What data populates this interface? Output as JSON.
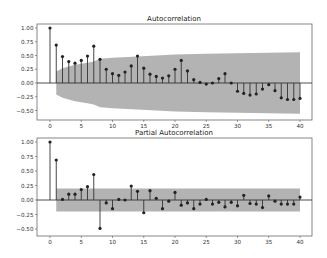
{
  "chart_data": [
    {
      "type": "stem",
      "title": "Autocorrelation",
      "xlabel": "",
      "ylabel": "",
      "xlim": [
        -2,
        42
      ],
      "ylim": [
        -0.6,
        1.05
      ],
      "xticks": [
        0,
        5,
        10,
        15,
        20,
        25,
        30,
        35,
        40
      ],
      "yticks": [
        1.0,
        0.75,
        0.5,
        0.25,
        0.0,
        -0.25,
        -0.5
      ],
      "ytick_labels": [
        "1.00",
        "0.75",
        "0.50",
        "0.25",
        "0.00",
        "−0.25",
        "−0.50"
      ],
      "grid": false,
      "lags": [
        0,
        1,
        2,
        3,
        4,
        5,
        6,
        7,
        8,
        9,
        10,
        11,
        12,
        13,
        14,
        15,
        16,
        17,
        18,
        19,
        20,
        21,
        22,
        23,
        24,
        25,
        26,
        27,
        28,
        29,
        30,
        31,
        32,
        33,
        34,
        35,
        36,
        37,
        38,
        39,
        40
      ],
      "values": [
        1.0,
        0.69,
        0.48,
        0.39,
        0.36,
        0.41,
        0.49,
        0.67,
        0.43,
        0.25,
        0.17,
        0.14,
        0.2,
        0.31,
        0.49,
        0.27,
        0.16,
        0.12,
        0.09,
        0.13,
        0.25,
        0.41,
        0.22,
        0.06,
        0.01,
        -0.02,
        0.0,
        0.08,
        0.17,
        0.0,
        -0.15,
        -0.19,
        -0.22,
        -0.2,
        -0.11,
        -0.03,
        -0.14,
        -0.27,
        -0.3,
        -0.3,
        -0.28
      ],
      "confidence_band": {
        "lags": [
          1,
          2,
          3,
          4,
          5,
          6,
          7,
          8,
          10,
          14,
          20,
          25,
          30,
          35,
          40
        ],
        "upper": [
          0.21,
          0.27,
          0.3,
          0.33,
          0.35,
          0.37,
          0.39,
          0.44,
          0.46,
          0.48,
          0.52,
          0.53,
          0.54,
          0.55,
          0.56
        ]
      }
    },
    {
      "type": "stem",
      "title": "Partial Autocorrelation",
      "xlabel": "",
      "ylabel": "",
      "xlim": [
        -2,
        42
      ],
      "ylim": [
        -0.55,
        1.05
      ],
      "xticks": [
        0,
        5,
        10,
        15,
        20,
        25,
        30,
        35,
        40
      ],
      "yticks": [
        1.0,
        0.75,
        0.5,
        0.25,
        0.0,
        -0.25,
        -0.5
      ],
      "ytick_labels": [
        "1.00",
        "0.75",
        "0.50",
        "0.25",
        "0.00",
        "−0.25",
        "−0.50"
      ],
      "grid": false,
      "lags": [
        0,
        1,
        2,
        3,
        4,
        5,
        6,
        7,
        8,
        9,
        10,
        11,
        12,
        13,
        14,
        15,
        16,
        17,
        18,
        19,
        20,
        21,
        22,
        23,
        24,
        25,
        26,
        27,
        28,
        29,
        30,
        31,
        32,
        33,
        34,
        35,
        36,
        37,
        38,
        39,
        40
      ],
      "values": [
        1.0,
        0.69,
        0.01,
        0.1,
        0.1,
        0.18,
        0.23,
        0.44,
        -0.49,
        -0.05,
        -0.15,
        0.01,
        0.0,
        0.24,
        0.15,
        -0.22,
        0.16,
        0.03,
        -0.15,
        -0.02,
        0.13,
        -0.09,
        -0.05,
        -0.15,
        -0.07,
        0.01,
        -0.07,
        -0.04,
        -0.12,
        -0.04,
        -0.1,
        0.08,
        -0.06,
        -0.07,
        -0.13,
        0.07,
        -0.02,
        -0.07,
        -0.07,
        -0.07,
        0.05
      ],
      "confidence_band": {
        "lags": [
          1,
          40
        ],
        "upper": [
          0.2,
          0.2
        ]
      }
    }
  ],
  "colors": {
    "stem": "#333333",
    "marker": "#222222",
    "band": "#b3b3b3",
    "zero_line": "#222222",
    "frame": "#555555"
  },
  "layout": {
    "axes": [
      {
        "left": 37,
        "right": 312,
        "top": 24,
        "bottom": 120,
        "x0": 50,
        "xPerLag": 6.25,
        "yZero": 83,
        "yPerUnit": 55
      },
      {
        "left": 37,
        "right": 312,
        "top": 138,
        "bottom": 236,
        "x0": 50,
        "xPerLag": 6.25,
        "yZero": 200,
        "yPerUnit": 58
      }
    ]
  }
}
